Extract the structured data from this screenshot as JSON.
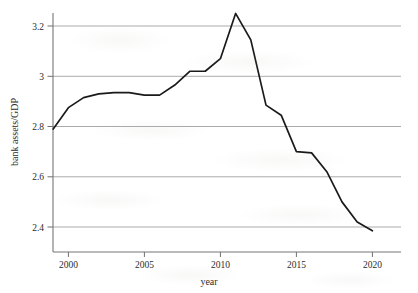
{
  "chart_data": {
    "type": "line",
    "title": "",
    "subtitle": "",
    "xlabel": "year",
    "ylabel": "bank assets/GDP",
    "xlim": [
      1998.2,
      2020.6
    ],
    "ylim": [
      2.32,
      3.29
    ],
    "grid": true,
    "grid_axis": "y",
    "legend": false,
    "legend_position": "none",
    "xticks": [
      2000,
      2005,
      2010,
      2015,
      2020
    ],
    "xtick_labels": [
      "2000",
      "2005",
      "2010",
      "2015",
      "2020"
    ],
    "yticks": [
      2.4,
      2.6,
      2.8,
      3.0,
      3.2
    ],
    "ytick_labels": [
      "2.4",
      "2.6",
      "2.8",
      "3",
      "3.2"
    ],
    "line_color": "#1a1a1a",
    "line_width": 1.7,
    "x": [
      1999,
      2000,
      2001,
      2002,
      2003,
      2004,
      2005,
      2006,
      2007,
      2008,
      2009,
      2010,
      2011,
      2012,
      2013,
      2014,
      2015,
      2016,
      2017,
      2018,
      2019,
      2020
    ],
    "values": [
      2.79,
      2.875,
      2.915,
      2.93,
      2.935,
      2.935,
      2.925,
      2.925,
      2.965,
      3.02,
      3.02,
      3.07,
      3.25,
      3.145,
      2.885,
      2.845,
      2.7,
      2.695,
      2.62,
      2.5,
      2.42,
      2.385
    ],
    "series": [
      {
        "name": "bank assets/GDP",
        "color": "#1a1a1a",
        "values": [
          2.79,
          2.875,
          2.915,
          2.93,
          2.935,
          2.935,
          2.925,
          2.925,
          2.965,
          3.02,
          3.02,
          3.07,
          3.25,
          3.145,
          2.885,
          2.845,
          2.7,
          2.695,
          2.62,
          2.5,
          2.42,
          2.385
        ]
      }
    ],
    "annotations": []
  },
  "axes": {
    "y_title": "bank assets/GDP",
    "x_title": "year",
    "y_tick_0": "2.4",
    "y_tick_1": "2.6",
    "y_tick_2": "2.8",
    "y_tick_3": "3",
    "y_tick_4": "3.2",
    "x_tick_0": "2000",
    "x_tick_1": "2005",
    "x_tick_2": "2010",
    "x_tick_3": "2015",
    "x_tick_4": "2020"
  },
  "style": {
    "background": "#ffffff",
    "grid_color": "#9b9b9b",
    "axis_color": "#6f6f6f",
    "text_color": "#2c2c2c"
  }
}
